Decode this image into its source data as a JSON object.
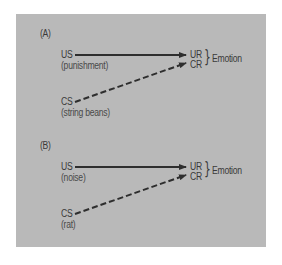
{
  "panels": [
    {
      "label": "(A)",
      "us": {
        "label": "US",
        "sub": "(punishment)"
      },
      "cs": {
        "label": "CS",
        "sub": "(string beans)"
      },
      "ur": "UR",
      "cr": "CR",
      "brace": "}",
      "response": "Emotion"
    },
    {
      "label": "(B)",
      "us": {
        "label": "US",
        "sub": "(noise)"
      },
      "cs": {
        "label": "CS",
        "sub": "(rat)"
      },
      "ur": "UR",
      "cr": "CR",
      "brace": "}",
      "response": "Emotion"
    }
  ],
  "colors": {
    "panel_bg": "#b9b9b9",
    "ink": "#2e2e2e"
  }
}
